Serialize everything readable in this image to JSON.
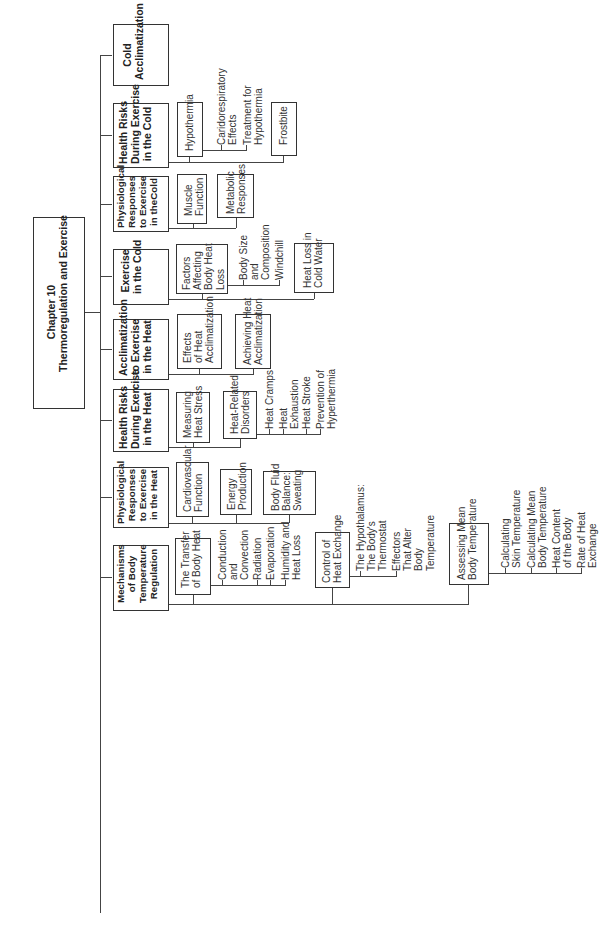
{
  "chapter": {
    "title": "Chapter 10\nThermoregulation and Exercise"
  },
  "topics": [
    {
      "title": "Cold\nAcclimatization",
      "subtopics": []
    },
    {
      "title": "Health Risks\nDuring Exercise\nin the Cold",
      "subtopics": [
        {
          "title": "Hypothermia",
          "leaves": [
            "Caridorespiratory\nEffects",
            "Treatment for\nHypothermia"
          ]
        },
        {
          "title": "Frostbite",
          "leaves": []
        }
      ]
    },
    {
      "title": "Physiological\nResponses\nto Exercise\nin theCold",
      "subtopics": [
        {
          "title": "Muscle\nFunction",
          "leaves": []
        },
        {
          "title": "Metabolic\nResponses",
          "leaves": []
        }
      ]
    },
    {
      "title": "Exercise\nin the Cold",
      "subtopics": [
        {
          "title": "Factors\nAffecting\nBody Heat\nLoss",
          "leaves": [
            "Body Size\nand\nComposition",
            "Windchill"
          ]
        },
        {
          "title": "Heat Loss in\nCold Water",
          "leaves": []
        }
      ]
    },
    {
      "title": "Acclimatization\nto Exercise\nin the Heat",
      "subtopics": [
        {
          "title": "Effects\nof Heat\nAcclimatization",
          "leaves": []
        },
        {
          "title": "Achieving Heat\nAcclimatization",
          "leaves": []
        }
      ]
    },
    {
      "title": "Health Risks\nDuring Exercise\nin the Heat",
      "subtopics": [
        {
          "title": "Measuring\nHeat Stress",
          "leaves": []
        },
        {
          "title": "Heat-Related\nDisorders",
          "leaves": [
            "Heat Cramps",
            "Heat\nExhaustion",
            "Heat Stroke",
            "Prevention of\nHyperthermia"
          ]
        }
      ]
    },
    {
      "title": "Physiological\nResponses\nto Exercise\nin the Heat",
      "subtopics": [
        {
          "title": "Cardiovascular\nFunction",
          "leaves": []
        },
        {
          "title": "Energy\nProduction",
          "leaves": []
        },
        {
          "title": "Body Fluid\nBalance:\nSweating",
          "leaves": []
        }
      ]
    },
    {
      "title": "Mechanisms\nof Body\nTemperature\nRegulation",
      "subtopics": [
        {
          "title": "The Transfer\nof Body Heat",
          "leaves": [
            "Conduction\nand\nConvection",
            "Radiation",
            "Evaporation",
            "Humidity and\nHeat Loss"
          ]
        },
        {
          "title": "Control of\nHeat Exchange",
          "leaves": [
            "The Hypothalamus:\nThe Body's\nThermostat",
            "Effectors\nThat Alter\nBody\nTemperature"
          ]
        },
        {
          "title": "Assessing Mean\nBody Temperature",
          "leaves": [
            "Calculating\nSkin Temperature",
            "Calculating Mean\nBody Temperature",
            "Heat Content\nof the Body",
            "Rate of Heat\nExchange"
          ]
        }
      ]
    }
  ]
}
